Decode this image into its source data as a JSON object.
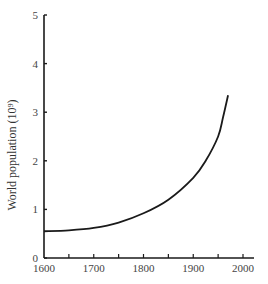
{
  "chart_data": {
    "type": "line",
    "title": "",
    "xlabel": "",
    "ylabel": "World population (10⁹)",
    "xlim": [
      1600,
      2000
    ],
    "ylim": [
      0,
      5
    ],
    "x_ticks": [
      "1600",
      "1700",
      "1800",
      "1900",
      "2000"
    ],
    "x_minor_ticks": [
      1650,
      1750,
      1850,
      1950
    ],
    "y_ticks": [
      "0",
      "1",
      "2",
      "3",
      "4",
      "5"
    ],
    "grid": false,
    "legend": null,
    "series": [
      {
        "name": "World population",
        "x": [
          1600,
          1650,
          1700,
          1750,
          1800,
          1850,
          1900,
          1925,
          1950,
          1960,
          1970
        ],
        "values": [
          0.55,
          0.57,
          0.62,
          0.73,
          0.92,
          1.2,
          1.65,
          2.0,
          2.5,
          2.9,
          3.35
        ]
      }
    ]
  }
}
